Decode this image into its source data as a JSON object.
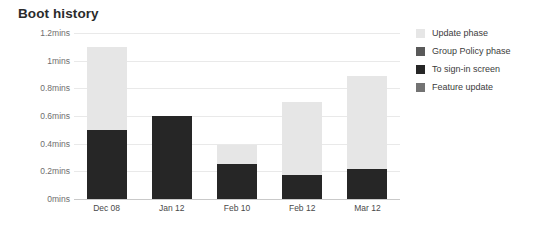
{
  "chart_data": {
    "type": "bar",
    "title": "Boot history",
    "xlabel": "",
    "ylabel": "",
    "ylim": [
      0,
      1.2
    ],
    "y_unit": "mins",
    "grid": true,
    "legend_position": "right",
    "stacked": true,
    "categories": [
      "Dec 08",
      "Jan 12",
      "Feb 10",
      "Feb 12",
      "Mar 12"
    ],
    "yticks": [
      {
        "value": 1.2,
        "label": "1.2mins"
      },
      {
        "value": 1.0,
        "label": "1mins"
      },
      {
        "value": 0.8,
        "label": "0.8mins"
      },
      {
        "value": 0.6,
        "label": "0.6mins"
      },
      {
        "value": 0.4,
        "label": "0.4mins"
      },
      {
        "value": 0.2,
        "label": "0.2mins"
      },
      {
        "value": 0.0,
        "label": "0mins"
      }
    ],
    "series": [
      {
        "name": "To sign-in screen",
        "color": "#262626",
        "values": [
          0.5,
          0.6,
          0.25,
          0.17,
          0.22
        ]
      },
      {
        "name": "Update phase",
        "color": "#e6e6e6",
        "values": [
          0.6,
          0.0,
          0.14,
          0.53,
          0.67
        ]
      }
    ],
    "totals": [
      1.1,
      0.6,
      0.39,
      0.7,
      0.89
    ],
    "legend": [
      {
        "label": "Update phase",
        "color": "#e6e6e6"
      },
      {
        "label": "Group Policy phase",
        "color": "#595959"
      },
      {
        "label": "To sign-in screen",
        "color": "#262626"
      },
      {
        "label": "Feature update",
        "color": "#737373"
      }
    ]
  }
}
